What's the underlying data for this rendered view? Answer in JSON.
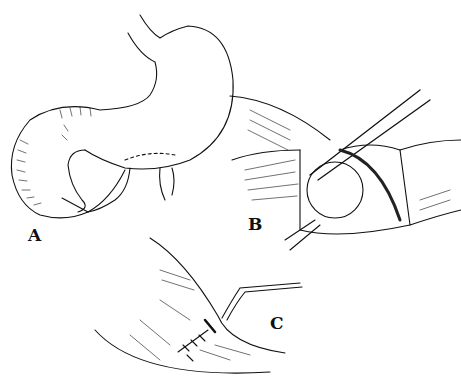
{
  "figure": {
    "panels": [
      {
        "id": "A",
        "label": "A",
        "description": "Stomach and duodenum overview"
      },
      {
        "id": "B",
        "label": "B",
        "description": "Opened bowel segment with instrument"
      },
      {
        "id": "C",
        "label": "C",
        "description": "Sutured closure with drain/tube"
      }
    ],
    "colors": {
      "ink": "#111111",
      "background": "#ffffff"
    }
  }
}
